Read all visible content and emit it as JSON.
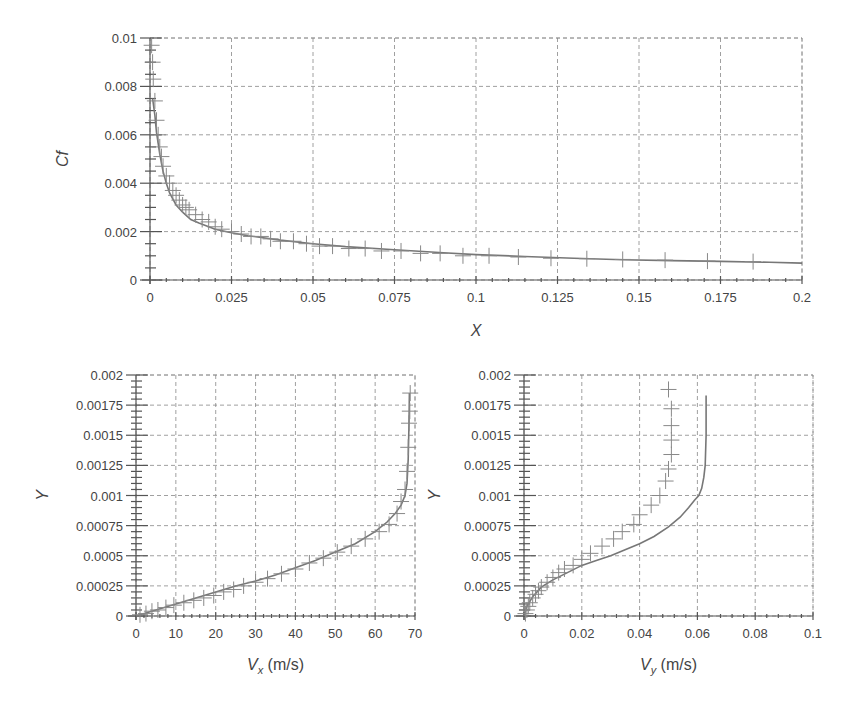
{
  "chart_data": [
    {
      "id": "cf",
      "type": "line",
      "title": "",
      "xlabel": "X",
      "ylabel": "Cf",
      "xlim": [
        0,
        0.2
      ],
      "ylim": [
        0,
        0.01
      ],
      "xticks": [
        0,
        0.025,
        0.05,
        0.075,
        0.1,
        0.125,
        0.15,
        0.175,
        0.2
      ],
      "xtick_labels": [
        "0",
        "0.025",
        "0.05",
        "0.075",
        "0.1",
        "0.125",
        "0.15",
        "0.175",
        "0.2"
      ],
      "yticks": [
        0,
        0.002,
        0.004,
        0.006,
        0.008,
        0.01
      ],
      "ytick_labels": [
        "0",
        "0.002",
        "0.004",
        "0.006",
        "0.008",
        "0.01"
      ],
      "grid": true,
      "legend": null,
      "series": [
        {
          "name": "computed",
          "style": "line",
          "x": [
            0.0008,
            0.0015,
            0.002,
            0.003,
            0.004,
            0.005,
            0.006,
            0.008,
            0.01,
            0.0125,
            0.015,
            0.02,
            0.025,
            0.03,
            0.04,
            0.05,
            0.06,
            0.075,
            0.09,
            0.1,
            0.115,
            0.13,
            0.145,
            0.16,
            0.175,
            0.19,
            0.2
          ],
          "y": [
            0.0075,
            0.0068,
            0.0061,
            0.0052,
            0.0045,
            0.004,
            0.0036,
            0.0031,
            0.0028,
            0.0025,
            0.00235,
            0.0021,
            0.00195,
            0.00183,
            0.00165,
            0.0015,
            0.00138,
            0.00125,
            0.00113,
            0.00105,
            0.00097,
            0.0009,
            0.00084,
            0.0008,
            0.00077,
            0.00073,
            0.0007
          ]
        },
        {
          "name": "reference",
          "style": "plus-marker",
          "x": [
            0.0005,
            0.0008,
            0.001,
            0.0015,
            0.002,
            0.0025,
            0.003,
            0.0035,
            0.004,
            0.005,
            0.006,
            0.007,
            0.008,
            0.009,
            0.01,
            0.011,
            0.012,
            0.014,
            0.016,
            0.018,
            0.02,
            0.022,
            0.025,
            0.028,
            0.031,
            0.034,
            0.037,
            0.04,
            0.044,
            0.048,
            0.052,
            0.056,
            0.061,
            0.066,
            0.071,
            0.077,
            0.083,
            0.089,
            0.096,
            0.104,
            0.113,
            0.123,
            0.134,
            0.145,
            0.158,
            0.171,
            0.185
          ],
          "y": [
            0.0097,
            0.009,
            0.0083,
            0.0074,
            0.0066,
            0.006,
            0.0055,
            0.0051,
            0.0047,
            0.0043,
            0.004,
            0.0037,
            0.0035,
            0.0033,
            0.0031,
            0.003,
            0.0029,
            0.0027,
            0.0025,
            0.0024,
            0.0022,
            0.0021,
            0.002,
            0.0019,
            0.0018,
            0.0018,
            0.0017,
            0.0016,
            0.0016,
            0.0015,
            0.0014,
            0.0014,
            0.0013,
            0.0013,
            0.0012,
            0.0012,
            0.0011,
            0.0011,
            0.001,
            0.001,
            0.00095,
            0.0009,
            0.00088,
            0.00085,
            0.00082,
            0.00078,
            0.00076
          ]
        }
      ]
    },
    {
      "id": "vx",
      "type": "line",
      "title": "",
      "xlabel": "V_x (m/s)",
      "xlabel_main": "V",
      "xlabel_sub": "x",
      "xlabel_unit": " (m/s)",
      "ylabel": "Y",
      "xlim": [
        0,
        70
      ],
      "ylim": [
        0,
        0.002
      ],
      "xticks": [
        0,
        10,
        20,
        30,
        40,
        50,
        60,
        70
      ],
      "xtick_labels": [
        "0",
        "10",
        "20",
        "30",
        "40",
        "50",
        "60",
        "70"
      ],
      "yticks": [
        0,
        0.00025,
        0.0005,
        0.00075,
        0.001,
        0.00125,
        0.0015,
        0.00175,
        0.002
      ],
      "ytick_labels": [
        "0",
        "0.00025",
        "0.0005",
        "0.00075",
        "0.001",
        "0.00125",
        "0.0015",
        "0.00175",
        "0.002"
      ],
      "grid": true,
      "legend": null,
      "series": [
        {
          "name": "computed",
          "style": "line",
          "x": [
            0,
            5,
            10,
            15,
            20,
            25,
            30,
            35,
            40,
            45,
            50,
            55,
            60,
            63,
            65,
            66.5,
            67.5,
            68,
            68.3,
            68.5,
            68.6
          ],
          "y": [
            0,
            5e-05,
            0.0001,
            0.00015,
            0.0002,
            0.00025,
            0.00029,
            0.00034,
            0.0004,
            0.00046,
            0.00053,
            0.0006,
            0.0007,
            0.00078,
            0.00085,
            0.00092,
            0.001,
            0.0011,
            0.0013,
            0.0016,
            0.00185
          ]
        },
        {
          "name": "reference",
          "style": "plus-marker",
          "x": [
            1,
            2.5,
            4,
            5.5,
            7.5,
            9.5,
            12,
            14.5,
            17,
            19.5,
            22,
            24.5,
            27,
            30,
            33,
            36.5,
            40,
            43.5,
            47,
            50.5,
            54,
            57.5,
            61,
            63.5,
            65.5,
            66.5,
            67.5,
            68,
            68.3,
            68.5,
            68.7,
            68.8
          ],
          "y": [
            1e-05,
            2e-05,
            4e-05,
            5e-05,
            7e-05,
            9e-05,
            0.00011,
            0.00013,
            0.00015,
            0.00017,
            0.0002,
            0.00022,
            0.00025,
            0.00028,
            0.00031,
            0.00035,
            0.00039,
            0.00044,
            0.00048,
            0.00053,
            0.00058,
            0.00064,
            0.0007,
            0.00076,
            0.00085,
            0.00095,
            0.00105,
            0.0012,
            0.0014,
            0.0016,
            0.0017,
            0.00185
          ]
        }
      ]
    },
    {
      "id": "vy",
      "type": "line",
      "title": "",
      "xlabel": "V_y (m/s)",
      "xlabel_main": "V",
      "xlabel_sub": "y",
      "xlabel_unit": " (m/s)",
      "ylabel": "Y",
      "xlim": [
        0,
        0.1
      ],
      "ylim": [
        0,
        0.002
      ],
      "xticks": [
        0,
        0.02,
        0.04,
        0.06,
        0.08,
        0.1
      ],
      "xtick_labels": [
        "0",
        "0.02",
        "0.04",
        "0.06",
        "0.08",
        "0.1"
      ],
      "yticks": [
        0,
        0.00025,
        0.0005,
        0.00075,
        0.001,
        0.00125,
        0.0015,
        0.00175,
        0.002
      ],
      "ytick_labels": [
        "0",
        "0.00025",
        "0.0005",
        "0.00075",
        "0.001",
        "0.00125",
        "0.0015",
        "0.00175",
        "0.002"
      ],
      "grid": true,
      "legend": null,
      "series": [
        {
          "name": "computed",
          "style": "line",
          "x": [
            0,
            0.001,
            0.003,
            0.006,
            0.01,
            0.015,
            0.02,
            0.025,
            0.03,
            0.035,
            0.04,
            0.045,
            0.05,
            0.054,
            0.057,
            0.059,
            0.0605,
            0.0615,
            0.0622,
            0.0627,
            0.063,
            0.063
          ],
          "y": [
            0,
            8e-05,
            0.00016,
            0.00024,
            0.0003,
            0.00036,
            0.00042,
            0.00046,
            0.0005,
            0.00055,
            0.0006,
            0.00066,
            0.00074,
            0.00082,
            0.0009,
            0.00096,
            0.001,
            0.00106,
            0.00115,
            0.00125,
            0.0015,
            0.00183
          ]
        },
        {
          "name": "reference",
          "style": "plus-marker",
          "x": [
            0.0005,
            0.001,
            0.0015,
            0.002,
            0.003,
            0.004,
            0.005,
            0.006,
            0.008,
            0.01,
            0.012,
            0.014,
            0.017,
            0.02,
            0.023,
            0.027,
            0.031,
            0.034,
            0.038,
            0.04,
            0.044,
            0.047,
            0.049,
            0.05,
            0.051,
            0.051,
            0.051,
            0.051,
            0.05
          ],
          "y": [
            2e-05,
            5e-05,
            8e-05,
            0.00011,
            0.00015,
            0.00018,
            0.00021,
            0.00024,
            0.00028,
            0.00032,
            0.00036,
            0.00039,
            0.00042,
            0.00047,
            0.00052,
            0.00058,
            0.00064,
            0.0007,
            0.00076,
            0.00084,
            0.00092,
            0.001,
            0.00112,
            0.00122,
            0.00134,
            0.00146,
            0.00158,
            0.00172,
            0.00188
          ]
        }
      ]
    }
  ],
  "layout": {
    "cf": {
      "left": 150,
      "top": 38,
      "right": 802,
      "bottom": 280
    },
    "vx": {
      "left": 136,
      "top": 375,
      "right": 415,
      "bottom": 616
    },
    "vy": {
      "left": 524,
      "top": 375,
      "right": 813,
      "bottom": 616
    }
  }
}
